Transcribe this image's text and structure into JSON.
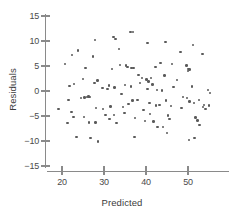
{
  "chart_data": {
    "type": "scatter",
    "title": "",
    "xlabel": "Predicted",
    "ylabel": "Residuals",
    "xlim": [
      17.5,
      60
    ],
    "ylim": [
      -16.5,
      16.5
    ],
    "grid": false,
    "legend": null,
    "xticks": [
      20,
      30,
      40,
      50
    ],
    "xtick_labels": [
      "20",
      "30",
      "40",
      "50"
    ],
    "yticks": [
      15,
      10,
      5,
      0,
      -5,
      -10,
      -15
    ],
    "ytick_labels": [
      "15",
      "10",
      "5",
      "0",
      "−5",
      "−10",
      "−15"
    ],
    "marker": "circle",
    "marker_color": "#5a5a5a",
    "points": [
      [
        20.7,
        5.4
      ],
      [
        19.2,
        -3.6
      ],
      [
        21.8,
        1.0
      ],
      [
        22.9,
        1.4
      ],
      [
        22.4,
        7.2
      ],
      [
        23.8,
        8.1
      ],
      [
        21.6,
        -1.8
      ],
      [
        22.2,
        -4.2
      ],
      [
        21.3,
        -6.4
      ],
      [
        22.8,
        -5.2
      ],
      [
        23.5,
        -9.2
      ],
      [
        24.5,
        -1.4
      ],
      [
        25.6,
        4.6
      ],
      [
        25.0,
        2.4
      ],
      [
        25.4,
        -1.3
      ],
      [
        26.0,
        -1.2
      ],
      [
        26.3,
        -1.1
      ],
      [
        26.6,
        -1.2
      ],
      [
        25.2,
        -5.2
      ],
      [
        26.4,
        -6.3
      ],
      [
        26.8,
        -9.4
      ],
      [
        27.9,
        10.2
      ],
      [
        27.4,
        6.9
      ],
      [
        27.8,
        1.6
      ],
      [
        28.4,
        2.1
      ],
      [
        28.1,
        -3.4
      ],
      [
        28.0,
        -6.3
      ],
      [
        28.6,
        -10.1
      ],
      [
        29.6,
        0.6
      ],
      [
        29.8,
        -3.6
      ],
      [
        30.4,
        -4.8
      ],
      [
        31.2,
        1.1
      ],
      [
        30.9,
        0.4
      ],
      [
        31.6,
        -3.1
      ],
      [
        31.3,
        -5.6
      ],
      [
        32.2,
        10.8
      ],
      [
        32.8,
        10.4
      ],
      [
        31.9,
        4.4
      ],
      [
        32.5,
        0.7
      ],
      [
        32.4,
        -4.8
      ],
      [
        33.0,
        -6.4
      ],
      [
        33.6,
        8.4
      ],
      [
        33.8,
        5.2
      ],
      [
        34.2,
        -0.6
      ],
      [
        34.5,
        -3.2
      ],
      [
        34.9,
        -4.4
      ],
      [
        35.2,
        5.1
      ],
      [
        35.6,
        4.8
      ],
      [
        35.0,
        1.2
      ],
      [
        35.8,
        -2.6
      ],
      [
        36.3,
        11.8
      ],
      [
        36.9,
        11.8
      ],
      [
        36.6,
        4.6
      ],
      [
        37.0,
        4.6
      ],
      [
        36.4,
        0.9
      ],
      [
        36.8,
        -1.9
      ],
      [
        37.4,
        -5.4
      ],
      [
        37.2,
        -9.2
      ],
      [
        38.2,
        3.2
      ],
      [
        38.6,
        1.6
      ],
      [
        38.0,
        -1.8
      ],
      [
        39.0,
        2.6
      ],
      [
        39.4,
        -3.8
      ],
      [
        39.8,
        -6.0
      ],
      [
        40.3,
        9.6
      ],
      [
        40.1,
        2.3
      ],
      [
        40.6,
        1.9
      ],
      [
        40.4,
        0.4
      ],
      [
        40.8,
        -2.4
      ],
      [
        41.2,
        2.6
      ],
      [
        41.6,
        1.3
      ],
      [
        41.0,
        -4.6
      ],
      [
        41.8,
        -6.1
      ],
      [
        42.2,
        4.8
      ],
      [
        42.6,
        0.2
      ],
      [
        42.4,
        -2.9
      ],
      [
        42.8,
        -7.2
      ],
      [
        43.4,
        5.6
      ],
      [
        43.8,
        0.1
      ],
      [
        43.2,
        -2.8
      ],
      [
        44.0,
        -7.2
      ],
      [
        44.6,
        9.8
      ],
      [
        44.4,
        3.1
      ],
      [
        44.8,
        -1.9
      ],
      [
        45.2,
        -4.9
      ],
      [
        45.6,
        -5.6
      ],
      [
        45.0,
        -8.4
      ],
      [
        46.2,
        5.4
      ],
      [
        46.6,
        0.8
      ],
      [
        46.0,
        -3.0
      ],
      [
        47.4,
        2.2
      ],
      [
        48.2,
        7.8
      ],
      [
        48.8,
        -1.2
      ],
      [
        48.4,
        -3.4
      ],
      [
        49.6,
        5.1
      ],
      [
        50.1,
        4.4
      ],
      [
        50.3,
        4.3
      ],
      [
        50.0,
        4.0
      ],
      [
        49.8,
        -1.4
      ],
      [
        50.4,
        -2.1
      ],
      [
        50.2,
        -9.8
      ],
      [
        51.2,
        9.2
      ],
      [
        51.0,
        0.9
      ],
      [
        51.4,
        -2.4
      ],
      [
        51.8,
        -5.3
      ],
      [
        51.6,
        -9.4
      ],
      [
        52.6,
        -1.8
      ],
      [
        52.2,
        -5.9
      ],
      [
        52.8,
        -6.8
      ],
      [
        53.4,
        7.4
      ],
      [
        53.8,
        -2.8
      ],
      [
        53.6,
        -3.2
      ],
      [
        54.2,
        -3.6
      ],
      [
        54.8,
        0.2
      ],
      [
        55.2,
        -0.4
      ],
      [
        55.0,
        -2.9
      ]
    ]
  },
  "axis": {
    "x_title": "Predicted",
    "y_title": "Residuals"
  }
}
